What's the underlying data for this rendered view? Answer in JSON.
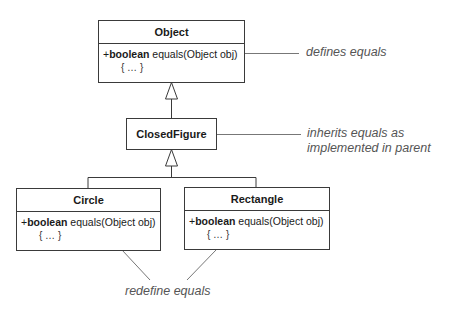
{
  "diagram": {
    "type": "UML class diagram",
    "classes": {
      "object": {
        "name": "Object",
        "visibility": "+",
        "return_type": "boolean",
        "method": "equals(Object obj)",
        "body": "{ … }"
      },
      "closed_figure": {
        "name": "ClosedFigure"
      },
      "circle": {
        "name": "Circle",
        "visibility": "+",
        "return_type": "boolean",
        "method": "equals(Object obj)",
        "body": "{ … }"
      },
      "rectangle": {
        "name": "Rectangle",
        "visibility": "+",
        "return_type": "boolean",
        "method": "equals(Object obj)",
        "body": "{ … }"
      }
    },
    "relationships": [
      {
        "from": "ClosedFigure",
        "to": "Object",
        "kind": "generalization"
      },
      {
        "from": "Circle",
        "to": "ClosedFigure",
        "kind": "generalization"
      },
      {
        "from": "Rectangle",
        "to": "ClosedFigure",
        "kind": "generalization"
      }
    ],
    "notes": {
      "object_note": "defines equals",
      "closed_figure_note_line1": "inherits equals as",
      "closed_figure_note_line2": "implemented in parent",
      "subclasses_note": "redefine equals"
    },
    "colors": {
      "line": "#3a3a3a",
      "note_text": "#555555",
      "background": "#ffffff"
    }
  }
}
